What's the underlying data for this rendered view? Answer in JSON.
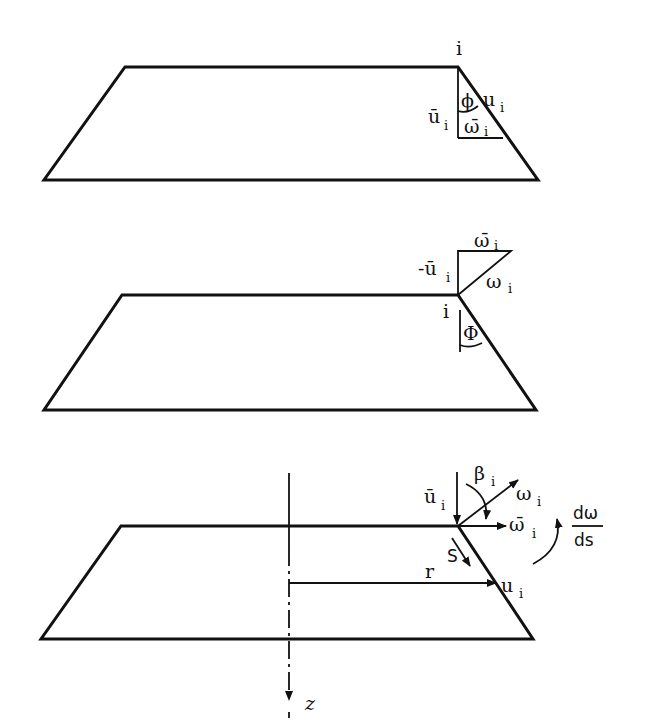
{
  "figure": {
    "panels": [
      {
        "id": "panel-1",
        "node_label": "i",
        "labels": {
          "u_bar": "ū",
          "u_bar_sub": "i",
          "u": "u",
          "u_sub": "i",
          "w_bar": "ω̄",
          "w_bar_sub": "i",
          "phi": "ϕ"
        }
      },
      {
        "id": "panel-2",
        "node_label": "i",
        "labels": {
          "neg_u_bar": "-ū",
          "neg_u_bar_sub": "i",
          "w_bar": "ω̄",
          "w_bar_sub": "i",
          "w": "ω",
          "w_sub": "i",
          "phi": "Φ"
        }
      },
      {
        "id": "panel-3",
        "labels": {
          "u_bar": "ū",
          "u_bar_sub": "i",
          "beta": "β",
          "beta_sub": "i",
          "w": "ω",
          "w_sub": "i",
          "w_bar": "ω̄",
          "w_bar_sub": "i",
          "s": "S",
          "r": "r",
          "u": "u",
          "u_sub": "i",
          "dw_num": "dω",
          "dw_den": "ds",
          "z_axis": "z"
        }
      }
    ],
    "colors": {
      "ink": "#111111",
      "paper": "#ffffff"
    }
  }
}
